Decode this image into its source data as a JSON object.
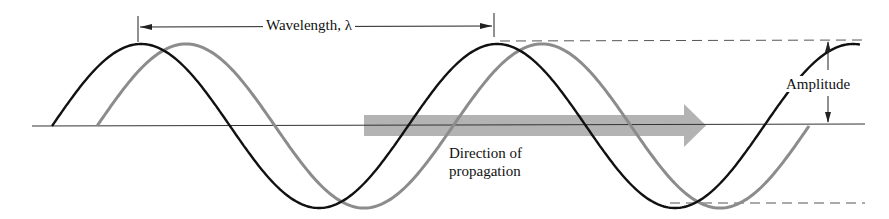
{
  "diagram": {
    "labels": {
      "wavelength": "Wavelength, λ",
      "amplitude": "Amplitude",
      "direction_line1": "Direction of",
      "direction_line2": "propagation"
    },
    "colors": {
      "wave_current": "#111111",
      "wave_later": "#8a8a8a",
      "arrow": "#b0b0b0",
      "axis": "#333333"
    },
    "geometry": {
      "axis_y": 126,
      "wavelength_px": 356,
      "amplitude_px": 82,
      "black_start_x": 52,
      "phase_shift_px": 45
    }
  }
}
